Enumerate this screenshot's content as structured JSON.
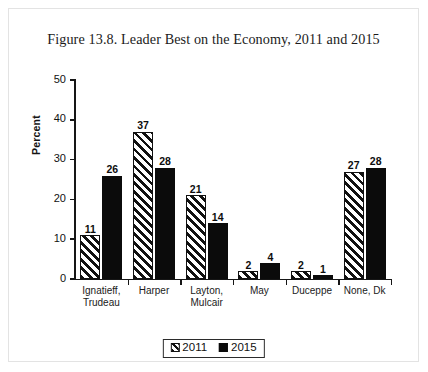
{
  "figure": {
    "title": "Figure 13.8. Leader Best on the Economy, 2011 and 2015"
  },
  "chart_data": {
    "type": "bar",
    "title": "Figure 13.8. Leader Best on the Economy, 2011 and 2015",
    "xlabel": "",
    "ylabel": "Percent",
    "ylim": [
      0,
      50
    ],
    "yticks": [
      0,
      10,
      20,
      30,
      40,
      50
    ],
    "grid": false,
    "legend_position": "bottom-center",
    "categories": [
      "Ignatieff, Trudeau",
      "Harper",
      "Layton, Mulcair",
      "May",
      "Duceppe",
      "None, Dk"
    ],
    "category_lines": [
      [
        "Ignatieff,",
        "Trudeau"
      ],
      [
        "Harper"
      ],
      [
        "Layton,",
        "Mulcair"
      ],
      [
        "May"
      ],
      [
        "Duceppe"
      ],
      [
        "None, Dk"
      ]
    ],
    "series": [
      {
        "name": "2011",
        "fill": "diagonal-hatch",
        "color": "#111111",
        "values": [
          11,
          37,
          21,
          2,
          2,
          27
        ]
      },
      {
        "name": "2015",
        "fill": "solid",
        "color": "#0b0b0b",
        "values": [
          26,
          28,
          14,
          4,
          1,
          28
        ]
      }
    ]
  },
  "legend": {
    "items": [
      {
        "label": "2011",
        "swatch": "hatch-swatch-icon"
      },
      {
        "label": "2015",
        "swatch": "solid-swatch-icon"
      }
    ]
  }
}
